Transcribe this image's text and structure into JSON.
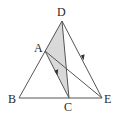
{
  "figure": {
    "labels": {
      "D": "D",
      "A": "A",
      "B": "B",
      "C": "C",
      "E": "E"
    },
    "points": {
      "D": [
        62,
        21
      ],
      "A": [
        45,
        51
      ],
      "B": [
        19,
        98
      ],
      "C": [
        69,
        98
      ],
      "E": [
        102,
        98
      ]
    },
    "shaded_region": [
      "A",
      "D",
      "C"
    ],
    "segments": [
      [
        "B",
        "D"
      ],
      [
        "D",
        "E"
      ],
      [
        "B",
        "E"
      ],
      [
        "D",
        "C"
      ],
      [
        "A",
        "C"
      ],
      [
        "A",
        "E"
      ]
    ],
    "arrows_on": [
      "A-C",
      "D-E"
    ],
    "colors": {
      "line": "#555555",
      "shade": "#d9d9d9",
      "text": "#2a2a2a"
    }
  }
}
